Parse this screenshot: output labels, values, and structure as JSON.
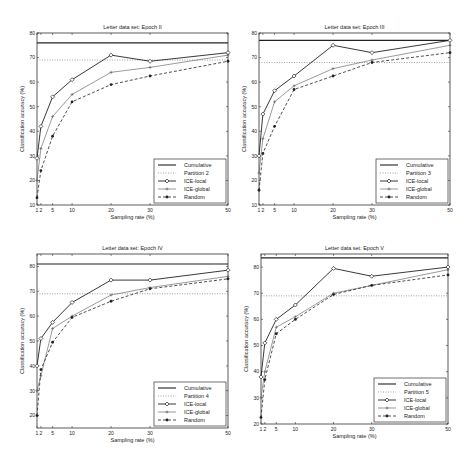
{
  "chart_data": [
    {
      "type": "line",
      "title": "Letter data set: Epoch II",
      "xlabel": "Sampling rate (%)",
      "ylabel": "Classification accuracy (%)",
      "x": [
        1,
        2,
        5,
        10,
        20,
        30,
        50
      ],
      "xticks": [
        1,
        2,
        5,
        10,
        20,
        30,
        50
      ],
      "xlim": [
        1,
        50
      ],
      "ylim": [
        10,
        80
      ],
      "yticks": [
        10,
        20,
        30,
        40,
        50,
        60,
        70,
        80
      ],
      "grid": false,
      "legend_position": "lower right",
      "series": [
        {
          "name": "Cumulative",
          "style": "solid",
          "values": [
            76,
            76,
            76,
            76,
            76,
            76,
            76
          ]
        },
        {
          "name": "Partition 2",
          "style": "dotted",
          "values": [
            69,
            69,
            69,
            69,
            69,
            69,
            69
          ]
        },
        {
          "name": "ICE-local",
          "style": "solid-diamond",
          "values": [
            29,
            42,
            54,
            61,
            71,
            68.5,
            72
          ]
        },
        {
          "name": "ICE-global",
          "style": "solid-plus",
          "values": [
            20,
            33,
            46,
            55,
            64,
            66,
            71
          ]
        },
        {
          "name": "Random",
          "style": "dashed-star",
          "values": [
            13,
            24,
            38,
            52,
            59,
            62.5,
            68.5
          ]
        }
      ]
    },
    {
      "type": "line",
      "title": "Letter data set: Epoch III",
      "xlabel": "Sampling rate (%)",
      "ylabel": "Classification accuracy (%)",
      "x": [
        1,
        2,
        5,
        10,
        20,
        30,
        50
      ],
      "xticks": [
        1,
        2,
        5,
        10,
        20,
        30,
        50
      ],
      "xlim": [
        1,
        50
      ],
      "ylim": [
        10,
        80
      ],
      "yticks": [
        10,
        20,
        30,
        40,
        50,
        60,
        70,
        80
      ],
      "grid": false,
      "legend_position": "lower right",
      "series": [
        {
          "name": "Cumulative",
          "style": "solid",
          "values": [
            77,
            77,
            77,
            77,
            77,
            77,
            77
          ]
        },
        {
          "name": "Partition 3",
          "style": "dotted",
          "values": [
            68,
            68,
            68,
            68,
            68,
            68,
            68
          ]
        },
        {
          "name": "ICE-local",
          "style": "solid-diamond",
          "values": [
            30,
            47,
            56.5,
            62.5,
            75,
            72,
            77
          ]
        },
        {
          "name": "ICE-global",
          "style": "solid-plus",
          "values": [
            23,
            37,
            52,
            58.5,
            65.5,
            69,
            75
          ]
        },
        {
          "name": "Random",
          "style": "dashed-star",
          "values": [
            16,
            31,
            42,
            57,
            62.5,
            68,
            72
          ]
        }
      ]
    },
    {
      "type": "line",
      "title": "Letter data set: Epoch IV",
      "xlabel": "Sampling rate (%)",
      "ylabel": "Classification accuracy (%)",
      "x": [
        1,
        2,
        5,
        10,
        20,
        30,
        50
      ],
      "xticks": [
        1,
        2,
        5,
        10,
        20,
        30,
        50
      ],
      "xlim": [
        1,
        50
      ],
      "ylim": [
        15,
        85
      ],
      "yticks": [
        20,
        30,
        40,
        50,
        60,
        70,
        80
      ],
      "grid": false,
      "legend_position": "lower right",
      "series": [
        {
          "name": "Cumulative",
          "style": "solid",
          "values": [
            81,
            81,
            81,
            81,
            81,
            81,
            81
          ]
        },
        {
          "name": "Partition 4",
          "style": "dotted",
          "values": [
            69,
            69,
            69,
            69,
            69,
            69,
            69
          ]
        },
        {
          "name": "ICE-local",
          "style": "solid-diamond",
          "values": [
            40,
            51,
            57.5,
            65.5,
            74.5,
            74.5,
            78.5
          ]
        },
        {
          "name": "ICE-global",
          "style": "solid-plus",
          "values": [
            30,
            36,
            55,
            60,
            68.5,
            71.5,
            76
          ]
        },
        {
          "name": "Random",
          "style": "dashed-star",
          "values": [
            20,
            38.5,
            49.5,
            59.5,
            66,
            71,
            75
          ]
        }
      ]
    },
    {
      "type": "line",
      "title": "Letter data set: Epoch V",
      "xlabel": "Sampling rate (%)",
      "ylabel": "Classification accuracy (%)",
      "x": [
        1,
        2,
        5,
        10,
        20,
        30,
        50
      ],
      "xticks": [
        1,
        2,
        5,
        10,
        20,
        30,
        50
      ],
      "xlim": [
        1,
        50
      ],
      "ylim": [
        20,
        85
      ],
      "yticks": [
        20,
        30,
        40,
        50,
        60,
        70,
        80
      ],
      "grid": false,
      "legend_position": "lower right",
      "series": [
        {
          "name": "Cumulative",
          "style": "solid",
          "values": [
            83.5,
            83.5,
            83.5,
            83.5,
            83.5,
            83.5,
            83.5
          ]
        },
        {
          "name": "Partition 5",
          "style": "dotted",
          "values": [
            69,
            69,
            69,
            69,
            69,
            69,
            69
          ]
        },
        {
          "name": "ICE-local",
          "style": "solid-diamond",
          "values": [
            38,
            51,
            60,
            65.5,
            79.5,
            76.5,
            80
          ]
        },
        {
          "name": "ICE-global",
          "style": "solid-plus",
          "values": [
            30,
            40,
            57,
            61,
            70,
            73,
            79
          ]
        },
        {
          "name": "Random",
          "style": "dashed-star",
          "values": [
            22.5,
            37,
            54.5,
            60,
            69.5,
            73,
            77
          ]
        }
      ]
    }
  ]
}
